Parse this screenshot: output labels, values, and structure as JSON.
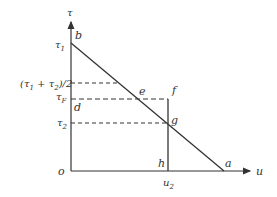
{
  "diagram": {
    "axes": {
      "y_label": "τ",
      "x_label": "u",
      "origin_label": "o"
    },
    "y_ticks": [
      {
        "label": "τ1",
        "main": "τ",
        "sub": "1"
      },
      {
        "label": "(τ1 + τ2)/2"
      },
      {
        "label": "τF",
        "main": "τ",
        "sub": "F"
      },
      {
        "label": "τ2",
        "main": "τ",
        "sub": "2"
      }
    ],
    "x_ticks": [
      {
        "label": "u2",
        "main": "u",
        "sub": "2"
      }
    ],
    "points": {
      "a": "a",
      "b": "b",
      "d": "d",
      "e": "e",
      "f": "f",
      "g": "g",
      "h": "h"
    },
    "mid_label_parts": {
      "open": "(τ",
      "s1": "1",
      "plus": " + τ",
      "s2": "2",
      "close": ")/2"
    },
    "colors": {
      "line": "#333333",
      "background": "#ffffff"
    }
  }
}
